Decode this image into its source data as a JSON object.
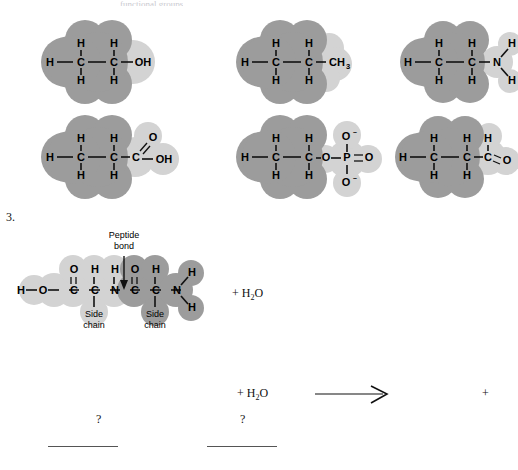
{
  "page": {
    "top_fragment": "functional groups",
    "question_number": "3."
  },
  "functional_group_grid": {
    "rows": [
      {
        "molecules": [
          {
            "name": "hydroxyl-ethanol",
            "backbone": [
              "H",
              "C",
              "C"
            ],
            "upper_hydrogens": [
              "H",
              "H"
            ],
            "lower_hydrogens": [
              "H",
              "H"
            ],
            "group_label": "OH",
            "group_name": "hydroxyl"
          },
          {
            "name": "methyl-propane",
            "backbone": [
              "H",
              "C",
              "C"
            ],
            "upper_hydrogens": [
              "H",
              "H"
            ],
            "lower_hydrogens": [
              "H",
              "H"
            ],
            "group_label": "CH",
            "group_sub": "3",
            "group_name": "methyl"
          },
          {
            "name": "amino-ethylamine",
            "backbone": [
              "H",
              "C",
              "C"
            ],
            "upper_hydrogens": [
              "H",
              "H"
            ],
            "lower_hydrogens": [
              "H",
              "H"
            ],
            "group_label": "N",
            "group_hydrogens": [
              "H",
              "H"
            ],
            "group_name": "amino"
          }
        ]
      },
      {
        "molecules": [
          {
            "name": "carboxyl-propanoic-acid",
            "backbone": [
              "H",
              "C",
              "C",
              "C"
            ],
            "upper_hydrogens": [
              "H",
              "H"
            ],
            "lower_hydrogens": [
              "H",
              "H"
            ],
            "double_bond_atom": "O",
            "group_label": "OH",
            "group_name": "carboxyl"
          },
          {
            "name": "phosphate-ethyl-phosphate",
            "backbone": [
              "H",
              "C",
              "C",
              "O",
              "P"
            ],
            "upper_hydrogens": [
              "H",
              "H"
            ],
            "lower_hydrogens": [
              "H",
              "H"
            ],
            "phosphate_top": "O",
            "phosphate_top_charge": "–",
            "phosphate_bottom": "O",
            "phosphate_bottom_charge": "–",
            "phosphate_right": "O",
            "group_name": "phosphate"
          },
          {
            "name": "carbonyl-propanal",
            "backbone": [
              "H",
              "C",
              "C",
              "C"
            ],
            "upper_hydrogens": [
              "H",
              "H",
              "H"
            ],
            "lower_hydrogens": [
              "H",
              "H"
            ],
            "double_bond_atom": "O",
            "group_name": "carbonyl"
          }
        ]
      }
    ]
  },
  "dipeptide": {
    "peptide_bond_label_line1": "Peptide",
    "peptide_bond_label_line2": "bond",
    "side_chain_label_line1": "Side",
    "side_chain_label_line2": "chain",
    "atoms": {
      "h_terminal": "H",
      "o_hydroxyl": "O",
      "c_carbonyl_1": "C",
      "o_carbonyl_1": "O",
      "c_alpha_1": "C",
      "h_alpha_1": "H",
      "n_amide": "N",
      "h_amide": "H",
      "c_carbonyl_2": "C",
      "o_carbonyl_2": "O",
      "c_alpha_2": "C",
      "h_alpha_2": "H",
      "n_terminal": "N",
      "n_h_upper": "H",
      "n_h_lower": "H"
    },
    "water_term": "+ H",
    "water_sub": "2",
    "water_end": "O"
  },
  "reaction_row": {
    "water_term": "+ H",
    "water_sub": "2",
    "water_end": "O",
    "blank_1_question": "?",
    "blank_2_question": "?",
    "arrow": "⟶",
    "plus": "+"
  }
}
